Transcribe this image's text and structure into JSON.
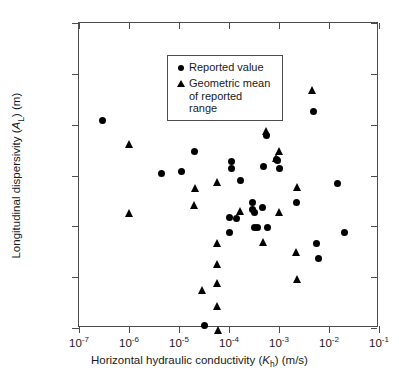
{
  "chart_data": {
    "type": "scatter",
    "title": "",
    "xlabel": "Horizontal hydraulic conductivity (Kh) (m/s)",
    "ylabel": "Longitudinal dispersivity (AL) (m)",
    "xscale": "log",
    "yscale": "log",
    "xlim": [
      1e-07,
      0.1
    ],
    "ylim": [
      0.01,
      10000
    ],
    "grid": false,
    "legend_position": "upper-left-inside",
    "xticks": [
      {
        "value": 1e-07,
        "mantissa": "10",
        "exponent": "-7"
      },
      {
        "value": 1e-06,
        "mantissa": "10",
        "exponent": "-6"
      },
      {
        "value": 1e-05,
        "mantissa": "10",
        "exponent": "-5"
      },
      {
        "value": 0.0001,
        "mantissa": "10",
        "exponent": "-4"
      },
      {
        "value": 0.001,
        "mantissa": "10",
        "exponent": "-3"
      },
      {
        "value": 0.01,
        "mantissa": "10",
        "exponent": "-2"
      },
      {
        "value": 0.1,
        "mantissa": "10",
        "exponent": "-1"
      }
    ],
    "yticks": [
      {
        "value": 10000,
        "label": "10,000"
      },
      {
        "value": 1000,
        "label": "1,000"
      },
      {
        "value": 100,
        "label": "100"
      },
      {
        "value": 10,
        "label": "10"
      },
      {
        "value": 1,
        "label": "1.0"
      },
      {
        "value": 0.1,
        "label": "0.1"
      },
      {
        "value": 0.01,
        "label": "0.01"
      }
    ],
    "series": [
      {
        "name": "Reported value",
        "marker": "circle",
        "color": "#000000",
        "points": [
          [
            3e-07,
            120
          ],
          [
            4.5e-06,
            11
          ],
          [
            1.1e-05,
            12
          ],
          [
            2e-05,
            30
          ],
          [
            3.2e-05,
            0.011
          ],
          [
            0.00011,
            19
          ],
          [
            0.00011,
            13.5
          ],
          [
            0.0001,
            1.5
          ],
          [
            0.0001,
            0.75
          ],
          [
            0.00017,
            7.8
          ],
          [
            0.00014,
            1.45
          ],
          [
            0.0003,
            3.0
          ],
          [
            0.0003,
            2.1
          ],
          [
            0.00032,
            1.9
          ],
          [
            0.00033,
            0.95
          ],
          [
            0.00037,
            0.95
          ],
          [
            0.0005,
            15
          ],
          [
            0.00046,
            2.4
          ],
          [
            0.0006,
            0.97
          ],
          [
            0.00055,
            60
          ],
          [
            0.0009,
            21
          ],
          [
            0.00095,
            20
          ],
          [
            0.001,
            14
          ],
          [
            0.0022,
            3.0
          ],
          [
            0.0048,
            180
          ],
          [
            0.0055,
            0.46
          ],
          [
            0.0062,
            0.23
          ],
          [
            0.015,
            7.0
          ],
          [
            0.02,
            0.74
          ]
        ]
      },
      {
        "name": "Geometric mean of reported range",
        "marker": "triangle",
        "color": "#000000",
        "points": [
          [
            1e-06,
            42
          ],
          [
            1e-06,
            1.8
          ],
          [
            2.1e-05,
            5.8
          ],
          [
            2e-05,
            2.6
          ],
          [
            3e-05,
            0.055
          ],
          [
            6e-05,
            7.4
          ],
          [
            6e-05,
            0.48
          ],
          [
            6e-05,
            0.18
          ],
          [
            6e-05,
            0.078
          ],
          [
            6e-05,
            0.027
          ],
          [
            6.2e-05,
            0.009
          ],
          [
            0.00017,
            2.0
          ],
          [
            0.0005,
            0.49
          ],
          [
            0.00055,
            75
          ],
          [
            0.0009,
            22
          ],
          [
            0.001,
            30
          ],
          [
            0.001,
            1.9
          ],
          [
            0.0022,
            0.31
          ],
          [
            0.0023,
            0.09
          ],
          [
            0.0023,
            6.0
          ],
          [
            0.0046,
            480
          ]
        ]
      }
    ]
  },
  "legend": {
    "items": [
      {
        "marker": "circle",
        "label": "Reported value"
      },
      {
        "marker": "triangle",
        "label": "Geometric mean\nof reported\nrange"
      }
    ]
  },
  "axis_titles": {
    "x_prefix": "Horizontal hydraulic conductivity (",
    "x_italic": "K",
    "x_sub": "h",
    "x_suffix": ") (m/s)",
    "y_prefix": "Longitudinal dispersivity (",
    "y_italic": "A",
    "y_sub": "L",
    "y_suffix": ") (m)"
  }
}
